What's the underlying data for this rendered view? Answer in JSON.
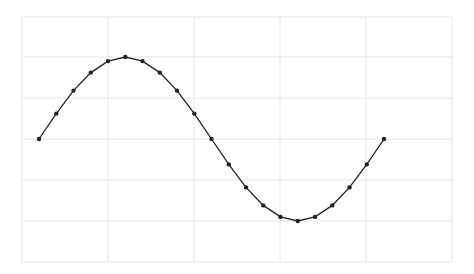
{
  "chart_data": {
    "type": "line",
    "title": "",
    "xlabel": "",
    "ylabel": "",
    "x": [
      0,
      0.314,
      0.628,
      0.942,
      1.257,
      1.571,
      1.885,
      2.199,
      2.513,
      2.827,
      3.142,
      3.456,
      3.77,
      4.084,
      4.398,
      4.712,
      5.027,
      5.341,
      5.655,
      5.969,
      6.283
    ],
    "series": [
      {
        "name": "sine",
        "values": [
          0,
          0.62,
          1.18,
          1.62,
          1.9,
          2.0,
          1.9,
          1.62,
          1.18,
          0.62,
          0,
          -0.62,
          -1.18,
          -1.62,
          -1.9,
          -2.0,
          -1.9,
          -1.62,
          -1.18,
          -0.62,
          0
        ],
        "color": "#222222",
        "marker": "circle"
      }
    ],
    "ylim": [
      -3,
      3
    ],
    "grid": true,
    "legend": null
  },
  "layout": {
    "plot_left": 22,
    "plot_right": 452,
    "plot_top": 17,
    "plot_bottom": 262,
    "x_grid_px": [
      22,
      108,
      194,
      280,
      366,
      452
    ],
    "y_grid_px": [
      17,
      57,
      98,
      139,
      180,
      221,
      262
    ],
    "data_x_start_px": 39,
    "data_x_step_px": 17.25,
    "y_zero_px": 139,
    "y_px_per_unit": 41,
    "grid_color": "#e6e6e6",
    "line_color": "#222222"
  }
}
